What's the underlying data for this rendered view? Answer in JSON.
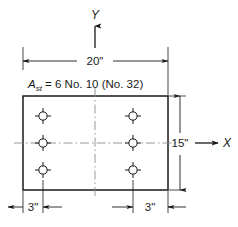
{
  "figure": {
    "colors": {
      "outline": "#1a1a1a",
      "dimension_line": "#1a1a1a",
      "centerline": "#8c8c8c",
      "bar_stroke": "#1a1a1a",
      "background": "#ffffff",
      "text": "#1a1a1a"
    }
  },
  "axes": {
    "y_label": "Y",
    "x_label": "X"
  },
  "dimensions": {
    "width_label": "20\"",
    "height_label": "15\"",
    "cover_left_label": "3\"",
    "cover_right_label": "3\""
  },
  "annotation": {
    "symbol": "A",
    "subscript": "st",
    "equals": "=",
    "value": "6 No. 10 (No. 32)",
    "full_text": "A_st = 6 No. 10 (No. 32)"
  },
  "section": {
    "bar_count": 6,
    "bar_rows": 3,
    "bar_columns": 2,
    "bars": [
      {
        "id": "bar-top-left",
        "col": 1,
        "row": 1
      },
      {
        "id": "bar-top-right",
        "col": 2,
        "row": 1
      },
      {
        "id": "bar-mid-left",
        "col": 1,
        "row": 2
      },
      {
        "id": "bar-mid-right",
        "col": 2,
        "row": 2
      },
      {
        "id": "bar-bot-left",
        "col": 1,
        "row": 3
      },
      {
        "id": "bar-bot-right",
        "col": 2,
        "row": 3
      }
    ]
  }
}
